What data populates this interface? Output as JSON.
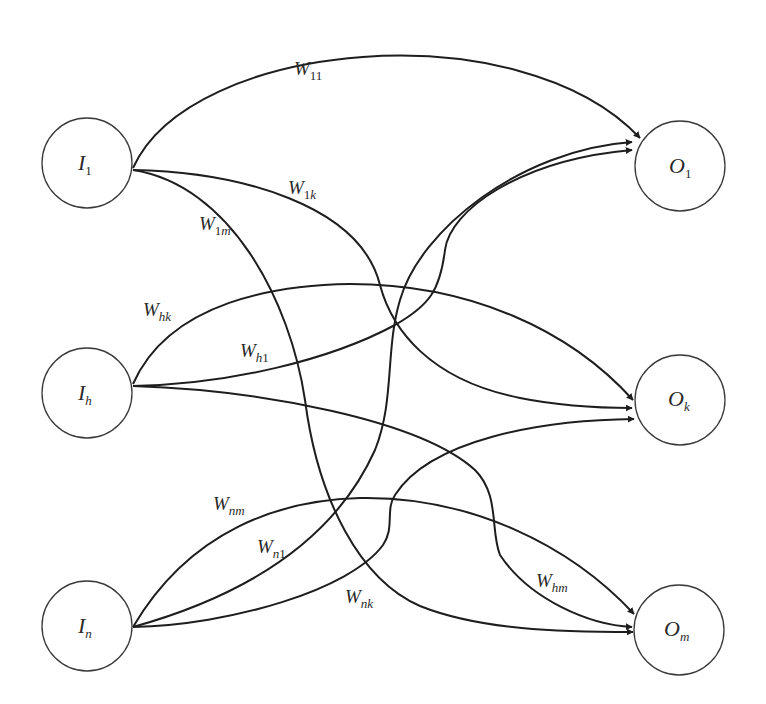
{
  "diagram": {
    "type": "bipartite-network",
    "colors": {
      "stroke": "#1e1e1e",
      "node_border": "#3a3a3a",
      "background": "#ffffff",
      "text": "#2a2a2a"
    },
    "input_nodes": [
      {
        "id": "I1",
        "main": "I",
        "sub": "1",
        "sub_italic": false
      },
      {
        "id": "Ih",
        "main": "I",
        "sub": "h",
        "sub_italic": true
      },
      {
        "id": "In",
        "main": "I",
        "sub": "n",
        "sub_italic": true
      }
    ],
    "output_nodes": [
      {
        "id": "O1",
        "main": "O",
        "sub": "1",
        "sub_italic": false
      },
      {
        "id": "Ok",
        "main": "O",
        "sub": "k",
        "sub_italic": true
      },
      {
        "id": "Om",
        "main": "O",
        "sub": "m",
        "sub_italic": true
      }
    ],
    "edges": [
      {
        "from": "I1",
        "to": "O1",
        "main": "W",
        "sub": "11"
      },
      {
        "from": "I1",
        "to": "Ok",
        "main": "W",
        "sub": "1k"
      },
      {
        "from": "I1",
        "to": "Om",
        "main": "W",
        "sub": "1m"
      },
      {
        "from": "Ih",
        "to": "Ok",
        "main": "W",
        "sub": "hk"
      },
      {
        "from": "Ih",
        "to": "O1",
        "main": "W",
        "sub": "h1"
      },
      {
        "from": "Ih",
        "to": "Om",
        "main": "W",
        "sub": "hm"
      },
      {
        "from": "In",
        "to": "Om",
        "main": "W",
        "sub": "nm"
      },
      {
        "from": "In",
        "to": "O1",
        "main": "W",
        "sub": "n1"
      },
      {
        "from": "In",
        "to": "Ok",
        "main": "W",
        "sub": "nk"
      }
    ]
  },
  "labels": {
    "I1": {
      "main": "I",
      "sub": "1"
    },
    "Ih": {
      "main": "I",
      "sub": "h"
    },
    "In": {
      "main": "I",
      "sub": "n"
    },
    "O1": {
      "main": "O",
      "sub": "1"
    },
    "Ok": {
      "main": "O",
      "sub": "k"
    },
    "Om": {
      "main": "O",
      "sub": "m"
    },
    "W11": {
      "main": "W",
      "sub": "11"
    },
    "W1k": {
      "main": "W",
      "sub_a": "1",
      "sub_b": "k"
    },
    "W1m": {
      "main": "W",
      "sub_a": "1",
      "sub_b": "m"
    },
    "Whk": {
      "main": "W",
      "sub": "hk"
    },
    "Wh1": {
      "main": "W",
      "sub_a": "h",
      "sub_b": "1"
    },
    "Whm": {
      "main": "W",
      "sub": "hm"
    },
    "Wnm": {
      "main": "W",
      "sub": "nm"
    },
    "Wn1": {
      "main": "W",
      "sub_a": "n",
      "sub_b": "1"
    },
    "Wnk": {
      "main": "W",
      "sub": "nk"
    }
  }
}
